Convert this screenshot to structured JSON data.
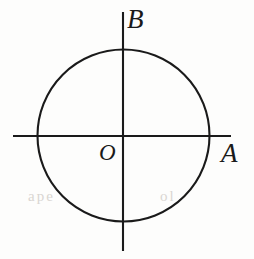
{
  "figure": {
    "background_color": "#fdfdfc",
    "stroke_color": "#1a1a1a",
    "label_color": "#1a1a1a"
  },
  "labels": {
    "point_a": "A",
    "point_b": "B",
    "origin": "O"
  },
  "artifacts": {
    "bleed_left": "ape",
    "bleed_right": "ol"
  },
  "chart_data": {
    "type": "diagram",
    "shapes": [
      {
        "name": "circle",
        "type": "circle",
        "center": [
          123.5,
          135.5
        ],
        "radius": 86,
        "stroke": "#1a1a1a",
        "stroke_width": 2.1,
        "fill": "none"
      },
      {
        "name": "horizontal-axis",
        "type": "line",
        "from": [
          13,
          136
        ],
        "to": [
          231,
          136
        ],
        "stroke": "#1a1a1a",
        "stroke_width": 2.1
      },
      {
        "name": "vertical-axis",
        "type": "line",
        "from": [
          123,
          12
        ],
        "to": [
          123,
          251
        ],
        "stroke": "#1a1a1a",
        "stroke_width": 2.1
      }
    ],
    "points": [
      {
        "label": "O",
        "role": "center",
        "at": [
          123.5,
          135.5
        ],
        "label_at": [
          99,
          141
        ]
      },
      {
        "label": "A",
        "role": "right-intersection",
        "at": [
          209.5,
          135.5
        ],
        "label_at": [
          221,
          140
        ]
      },
      {
        "label": "B",
        "role": "top-intersection",
        "at": [
          123.5,
          49.5
        ],
        "label_at": [
          127,
          6
        ]
      }
    ]
  }
}
